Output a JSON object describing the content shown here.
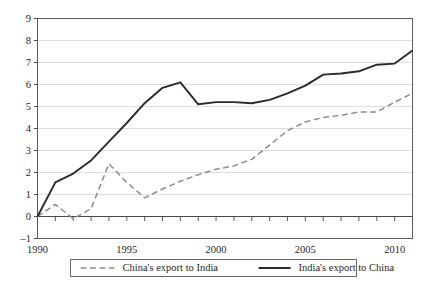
{
  "chart_data": {
    "type": "line",
    "title": "",
    "subtitle": "",
    "xlabel": "",
    "ylabel": "",
    "xlim": [
      1990,
      2011
    ],
    "ylim": [
      -1,
      9
    ],
    "y_ticks": [
      "-1",
      "0",
      "1",
      "2",
      "3",
      "4",
      "5",
      "6",
      "7",
      "8",
      "9"
    ],
    "x_ticks_labeled": [
      "1990",
      "1995",
      "2000",
      "2005",
      "2010"
    ],
    "x_tick_years": [
      1990,
      1991,
      1992,
      1993,
      1994,
      1995,
      1996,
      1997,
      1998,
      1999,
      2000,
      2001,
      2002,
      2003,
      2004,
      2005,
      2006,
      2007,
      2008,
      2009,
      2010,
      2011
    ],
    "grid": "horizontal",
    "legend_position": "bottom-outside",
    "x": [
      1990,
      1991,
      1992,
      1993,
      1994,
      1995,
      1996,
      1997,
      1998,
      1999,
      2000,
      2001,
      2002,
      2003,
      2004,
      2005,
      2006,
      2007,
      2008,
      2009,
      2010,
      2011
    ],
    "series": [
      {
        "name": "China's export to India",
        "style": "dashed",
        "color": "#8c8c8c",
        "values": [
          0.0,
          0.55,
          -0.1,
          0.35,
          2.4,
          1.55,
          0.85,
          1.25,
          1.6,
          1.9,
          2.15,
          2.3,
          2.6,
          3.25,
          3.9,
          4.3,
          4.5,
          4.6,
          4.75,
          4.75,
          5.2,
          5.6
        ]
      },
      {
        "name": "India's export to China",
        "style": "solid",
        "color": "#2a2a2a",
        "values": [
          0.0,
          1.55,
          1.95,
          2.55,
          3.4,
          4.25,
          5.15,
          5.85,
          6.1,
          5.1,
          5.2,
          5.2,
          5.15,
          5.3,
          5.6,
          5.95,
          6.45,
          6.5,
          6.6,
          6.9,
          6.95,
          7.55
        ]
      }
    ]
  },
  "legend": {
    "entries": [
      {
        "label": "China's export to India",
        "style": "dashed"
      },
      {
        "label": "India's export to China",
        "style": "solid"
      }
    ]
  }
}
